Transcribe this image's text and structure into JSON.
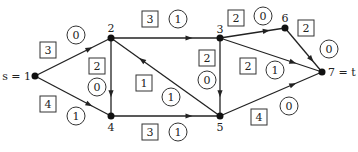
{
  "diagram": {
    "type": "flow-network",
    "nodes": [
      {
        "id": "1",
        "label": "s = 1",
        "x": 35,
        "y": 76,
        "lx": -4,
        "ly": 4,
        "anchor": "end"
      },
      {
        "id": "2",
        "label": "2",
        "x": 111,
        "y": 38,
        "lx": 0,
        "ly": -6,
        "anchor": "middle"
      },
      {
        "id": "4",
        "label": "4",
        "x": 111,
        "y": 116,
        "lx": 0,
        "ly": 15,
        "anchor": "middle"
      },
      {
        "id": "3",
        "label": "3",
        "x": 220,
        "y": 38,
        "lx": 0,
        "ly": -5,
        "anchor": "middle"
      },
      {
        "id": "5",
        "label": "5",
        "x": 220,
        "y": 116,
        "lx": 0,
        "ly": 15,
        "anchor": "middle"
      },
      {
        "id": "6",
        "label": "6",
        "x": 285,
        "y": 28,
        "lx": 0,
        "ly": -6,
        "anchor": "middle"
      },
      {
        "id": "7",
        "label": "7 = t",
        "x": 322,
        "y": 72,
        "lx": 6,
        "ly": 4,
        "anchor": "start"
      }
    ],
    "edges": [
      {
        "from": "1",
        "to": "2",
        "capacity": "3",
        "flow": "0",
        "cap_pos": [
          48,
          50
        ],
        "flow_pos": [
          76,
          35
        ]
      },
      {
        "from": "1",
        "to": "4",
        "capacity": "4",
        "flow": "1",
        "cap_pos": [
          48,
          104
        ],
        "flow_pos": [
          76,
          116
        ]
      },
      {
        "from": "2",
        "to": "4",
        "capacity": "2",
        "flow": "0",
        "cap_pos": [
          97,
          66
        ],
        "flow_pos": [
          97,
          87
        ]
      },
      {
        "from": "2",
        "to": "3",
        "capacity": "3",
        "flow": "1",
        "cap_pos": [
          150,
          19
        ],
        "flow_pos": [
          178,
          19
        ]
      },
      {
        "from": "5",
        "to": "2",
        "capacity": "1",
        "flow": "1",
        "cap_pos": [
          144,
          83
        ],
        "flow_pos": [
          171,
          97
        ]
      },
      {
        "from": "4",
        "to": "5",
        "capacity": "3",
        "flow": "1",
        "cap_pos": [
          150,
          132
        ],
        "flow_pos": [
          178,
          132
        ]
      },
      {
        "from": "3",
        "to": "5",
        "capacity": "2",
        "flow": "0",
        "cap_pos": [
          207,
          58
        ],
        "flow_pos": [
          207,
          80
        ]
      },
      {
        "from": "3",
        "to": "6",
        "capacity": "2",
        "flow": "0",
        "cap_pos": [
          236,
          18
        ],
        "flow_pos": [
          263,
          16
        ]
      },
      {
        "from": "3",
        "to": "7",
        "capacity": "2",
        "flow": "1",
        "cap_pos": [
          248,
          66
        ],
        "flow_pos": [
          275,
          70
        ]
      },
      {
        "from": "6",
        "to": "7",
        "capacity": "2",
        "flow": "0",
        "cap_pos": [
          306,
          28
        ],
        "flow_pos": [
          329,
          49
        ]
      },
      {
        "from": "5",
        "to": "7",
        "capacity": "4",
        "flow": "0",
        "cap_pos": [
          259,
          117
        ],
        "flow_pos": [
          289,
          106
        ]
      }
    ]
  }
}
